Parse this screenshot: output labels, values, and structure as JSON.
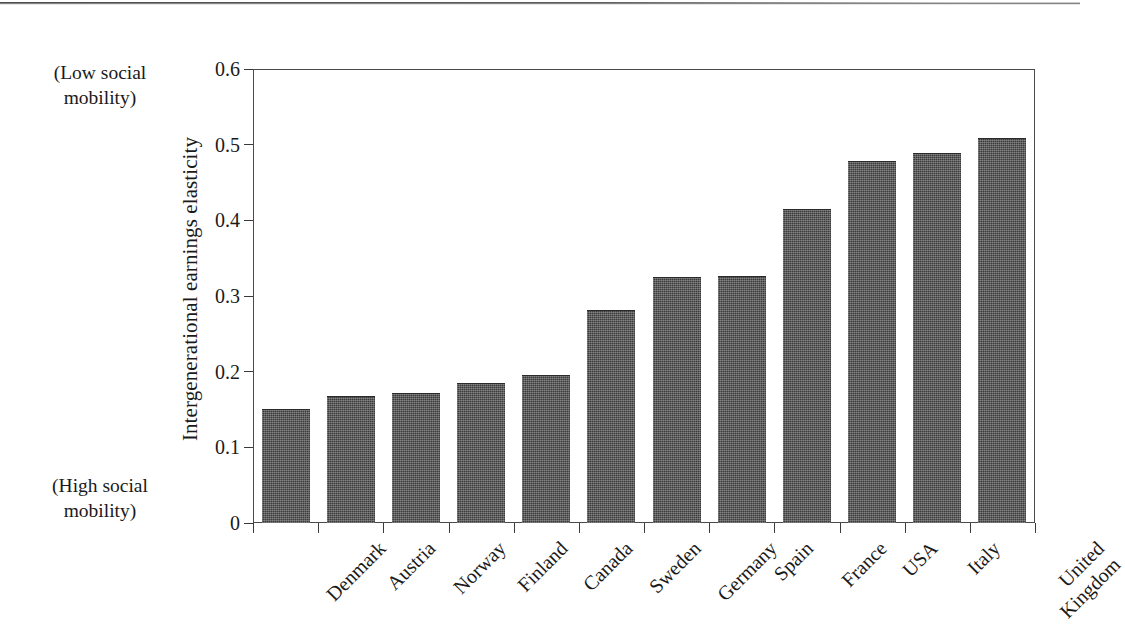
{
  "figure": {
    "kind": "scanned-book-figure",
    "bar_color": "#3b3b3b",
    "frame_color": "#4a4a4a",
    "background": "#ffffff"
  },
  "annotations": {
    "top_note_line1": "(Low social",
    "top_note_line2": "mobility)",
    "bottom_note_line1": "(High social",
    "bottom_note_line2": "mobility)"
  },
  "axis": {
    "y_title": "Intergenerational earnings elasticity",
    "y_ticks": [
      "0.6",
      "0.5",
      "0.4",
      "0.3",
      "0.2",
      "0.1",
      "0"
    ]
  },
  "chart_data": {
    "type": "bar",
    "title": "",
    "subtitle": "",
    "xlabel": "",
    "ylabel": "Intergenerational earnings elasticity",
    "ylim": [
      0,
      0.6
    ],
    "ytick_values": [
      0,
      0.1,
      0.2,
      0.3,
      0.4,
      0.5,
      0.6
    ],
    "ytick_labels": [
      "0",
      "0.1",
      "0.2",
      "0.3",
      "0.4",
      "0.5",
      "0.6"
    ],
    "grid": false,
    "legend": null,
    "legend_position": "none",
    "orientation": "vertical",
    "categories": [
      "Denmark",
      "Austria",
      "Norway",
      "Finland",
      "Canada",
      "Sweden",
      "Germany",
      "Spain",
      "France",
      "USA",
      "Italy",
      "United Kingdom"
    ],
    "category_label_lines": [
      [
        "Denmark"
      ],
      [
        "Austria"
      ],
      [
        "Norway"
      ],
      [
        "Finland"
      ],
      [
        "Canada"
      ],
      [
        "Sweden"
      ],
      [
        "Germany"
      ],
      [
        "Spain"
      ],
      [
        "France"
      ],
      [
        "USA"
      ],
      [
        "Italy"
      ],
      [
        "United",
        "Kingdom"
      ]
    ],
    "values": [
      0.151,
      0.168,
      0.172,
      0.185,
      0.195,
      0.281,
      0.325,
      0.326,
      0.415,
      0.479,
      0.489,
      0.509
    ],
    "annotations": [
      {
        "text": "(Low social mobility)",
        "position": "top-left-outside",
        "meaning": "high elasticity = low social mobility"
      },
      {
        "text": "(High social mobility)",
        "position": "bottom-left-outside",
        "meaning": "low elasticity = high social mobility"
      }
    ]
  }
}
